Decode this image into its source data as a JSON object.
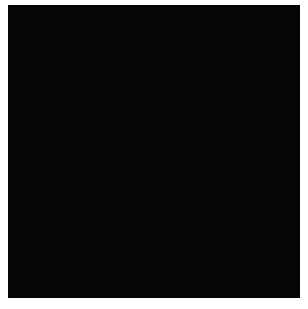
{
  "image": {
    "description": "Grid of stars with transiting exoplanet silhouettes, sorted by star size",
    "background_color": "#050505",
    "star_color": "#c9c9c9",
    "planet_color": "#000000"
  },
  "top_row": {
    "stars": [
      {
        "cx": 33,
        "cy": 35,
        "r": 30,
        "planet": {
          "dx": -8,
          "dy": 16,
          "r": 2.5
        }
      },
      {
        "cx": 58,
        "cy": 35,
        "r": 22
      },
      {
        "cx": 82,
        "cy": 35,
        "r": 20
      },
      {
        "cx": 103,
        "cy": 35,
        "r": 19
      },
      {
        "cx": 122,
        "cy": 35,
        "r": 18,
        "planet": {
          "dx": 0,
          "dy": 0,
          "r": 0.8
        }
      },
      {
        "cx": 140,
        "cy": 35,
        "r": 16
      },
      {
        "cx": 157,
        "cy": 35,
        "r": 15
      },
      {
        "cx": 173,
        "cy": 35,
        "r": 14
      },
      {
        "cx": 188,
        "cy": 35,
        "r": 14
      },
      {
        "cx": 202,
        "cy": 35,
        "r": 13
      },
      {
        "cx": 215,
        "cy": 35,
        "r": 13
      },
      {
        "cx": 228,
        "cy": 35,
        "r": 13,
        "planet": {
          "dx": 0,
          "dy": 0,
          "r": 0.8
        }
      },
      {
        "cx": 240,
        "cy": 35,
        "r": 12,
        "planet": {
          "dx": -2,
          "dy": 0,
          "r": 1.5
        }
      },
      {
        "cx": 251,
        "cy": 35,
        "r": 11
      },
      {
        "cx": 262,
        "cy": 35,
        "r": 11
      }
    ],
    "lone_star": {
      "cx": 246,
      "cy": 70,
      "r": 4
    }
  },
  "grid_rows": [
    {
      "y": 96,
      "d": 19,
      "step": 11,
      "count": 25,
      "x0": 2,
      "planets": [
        4,
        8,
        32
      ]
    },
    {
      "y": 117,
      "d": 16,
      "step": 8.2,
      "count": 34,
      "x0": 2,
      "planets": [
        3,
        6,
        24
      ]
    },
    {
      "y": 134,
      "d": 13,
      "step": 7.1,
      "count": 39,
      "x0": 2,
      "planets": [
        18,
        36
      ]
    },
    {
      "y": 148,
      "d": 12,
      "step": 6.6,
      "count": 43,
      "x0": 2,
      "planets": []
    },
    {
      "y": 161,
      "d": 11,
      "step": 6.3,
      "count": 45,
      "x0": 2,
      "planets": [
        1
      ]
    },
    {
      "y": 173,
      "d": 11,
      "step": 6.1,
      "count": 47,
      "x0": 2,
      "planets": [
        2,
        30,
        31
      ]
    },
    {
      "y": 184,
      "d": 10,
      "step": 5.8,
      "count": 49,
      "x0": 2,
      "planets": [
        10
      ]
    },
    {
      "y": 195,
      "d": 10,
      "step": 5.6,
      "count": 51,
      "x0": 2,
      "planets": [
        6,
        8
      ]
    },
    {
      "y": 205,
      "d": 9,
      "step": 5.4,
      "count": 53,
      "x0": 2,
      "planets": [
        47
      ]
    },
    {
      "y": 214,
      "d": 9,
      "step": 5.3,
      "count": 54,
      "x0": 2,
      "planets": [
        14
      ]
    },
    {
      "y": 223,
      "d": 9,
      "step": 5.1,
      "count": 56,
      "x0": 2,
      "planets": [
        3,
        6
      ]
    },
    {
      "y": 232,
      "d": 9,
      "step": 5.0,
      "count": 57,
      "x0": 2,
      "planets": [
        48
      ]
    },
    {
      "y": 241,
      "d": 8,
      "step": 4.9,
      "count": 59,
      "x0": 2,
      "planets": [
        40
      ]
    },
    {
      "y": 250,
      "d": 8,
      "step": 4.8,
      "count": 60,
      "x0": 2,
      "planets": [
        30
      ]
    },
    {
      "y": 258,
      "d": 8,
      "step": 4.6,
      "count": 62,
      "x0": 2,
      "planets": []
    },
    {
      "y": 266,
      "d": 7,
      "step": 4.5,
      "count": 64,
      "x0": 2,
      "planets": [
        44
      ]
    },
    {
      "y": 273,
      "d": 7,
      "step": 4.4,
      "count": 65,
      "x0": 2,
      "planets": [
        28
      ]
    },
    {
      "y": 280,
      "d": 6,
      "step": 4.2,
      "count": 52,
      "x0": 2,
      "planets": []
    }
  ]
}
